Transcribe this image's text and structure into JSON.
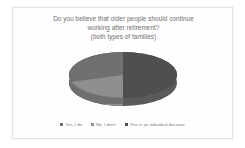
{
  "chart_data": {
    "type": "pie",
    "title": "Do you believe that older people should continue working after retirement? (both types of families)",
    "title_lines": [
      "Do you believe that older people should continue",
      "working after retirement?",
      "(both types of families)"
    ],
    "categories": [
      "Yes, I do",
      "No, I don't",
      "This is an individual decision"
    ],
    "values": [
      35,
      15,
      50
    ],
    "unit": "%",
    "colors": [
      "#707070",
      "#8f8f8f",
      "#4f4f4f"
    ],
    "legend_position": "bottom",
    "three_d": true,
    "grid": false,
    "xlabel": "",
    "ylabel": "",
    "data_labels_shown": false
  },
  "legend": {
    "items": [
      {
        "label": "Yes, I do",
        "color": "#707070"
      },
      {
        "label": "No, I don't",
        "color": "#8f8f8f"
      },
      {
        "label": "This is an individual decision",
        "color": "#4f4f4f"
      }
    ]
  },
  "frame": {
    "border_color": "#e3e3e3",
    "background_color": "#fefefe"
  }
}
